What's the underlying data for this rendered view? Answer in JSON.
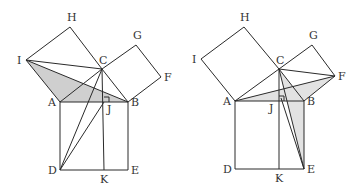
{
  "figures": [
    {
      "name": "left",
      "shade_color": "#cfcfcf",
      "points": {
        "H": [
          70,
          27
        ],
        "I": [
          26,
          60
        ],
        "C": [
          102,
          69
        ],
        "G": [
          136,
          45
        ],
        "F": [
          161,
          77
        ],
        "A": [
          60,
          102
        ],
        "B": [
          128,
          102
        ],
        "J": [
          104,
          102
        ],
        "D": [
          60,
          170
        ],
        "K": [
          104,
          170
        ],
        "E": [
          128,
          170
        ]
      },
      "shaded": [
        [
          "I",
          "A",
          "B"
        ]
      ],
      "segments": [
        [
          "A",
          "I"
        ],
        [
          "I",
          "H"
        ],
        [
          "H",
          "C"
        ],
        [
          "C",
          "A"
        ],
        [
          "C",
          "G"
        ],
        [
          "G",
          "F"
        ],
        [
          "F",
          "B"
        ],
        [
          "B",
          "C"
        ],
        [
          "A",
          "B"
        ],
        [
          "A",
          "D"
        ],
        [
          "D",
          "E"
        ],
        [
          "E",
          "B"
        ],
        [
          "C",
          "K"
        ],
        [
          "I",
          "C"
        ],
        [
          "I",
          "B"
        ],
        [
          "D",
          "C"
        ],
        [
          "D",
          "J"
        ]
      ],
      "labels": [
        {
          "text": "H",
          "pt": "H",
          "dx": -3,
          "dy": -6
        },
        {
          "text": "I",
          "pt": "I",
          "dx": -9,
          "dy": 4
        },
        {
          "text": "C",
          "pt": "C",
          "dx": -3,
          "dy": -5
        },
        {
          "text": "G",
          "pt": "G",
          "dx": -3,
          "dy": -6
        },
        {
          "text": "F",
          "pt": "F",
          "dx": 3,
          "dy": 4
        },
        {
          "text": "A",
          "pt": "A",
          "dx": -12,
          "dy": 4
        },
        {
          "text": "J",
          "pt": "J",
          "dx": 3,
          "dy": 11
        },
        {
          "text": "B",
          "pt": "B",
          "dx": 3,
          "dy": 4
        },
        {
          "text": "D",
          "pt": "D",
          "dx": -12,
          "dy": 4
        },
        {
          "text": "K",
          "pt": "K",
          "dx": -4,
          "dy": 13
        },
        {
          "text": "E",
          "pt": "E",
          "dx": 3,
          "dy": 4
        }
      ]
    },
    {
      "name": "right",
      "shade_color": "#e2e2e2",
      "points": {
        "H": [
          244,
          27
        ],
        "I": [
          201,
          59
        ],
        "C": [
          279,
          69
        ],
        "G": [
          312,
          45
        ],
        "F": [
          335,
          76
        ],
        "A": [
          235,
          101
        ],
        "B": [
          304,
          101
        ],
        "J": [
          279,
          101
        ],
        "D": [
          235,
          169
        ],
        "K": [
          279,
          169
        ],
        "E": [
          304,
          169
        ],
        "P": [
          281,
          98
        ]
      },
      "shaded": [
        [
          "A",
          "F",
          "B"
        ],
        [
          "C",
          "B",
          "E"
        ]
      ],
      "segments": [
        [
          "A",
          "I"
        ],
        [
          "I",
          "H"
        ],
        [
          "H",
          "C"
        ],
        [
          "C",
          "A"
        ],
        [
          "C",
          "G"
        ],
        [
          "G",
          "F"
        ],
        [
          "F",
          "B"
        ],
        [
          "B",
          "C"
        ],
        [
          "A",
          "B"
        ],
        [
          "A",
          "D"
        ],
        [
          "D",
          "E"
        ],
        [
          "E",
          "B"
        ],
        [
          "C",
          "K"
        ],
        [
          "C",
          "F"
        ],
        [
          "A",
          "F"
        ],
        [
          "C",
          "E"
        ],
        [
          "P",
          "E"
        ]
      ],
      "labels": [
        {
          "text": "H",
          "pt": "H",
          "dx": -4,
          "dy": -6
        },
        {
          "text": "I",
          "pt": "I",
          "dx": -9,
          "dy": 4
        },
        {
          "text": "C",
          "pt": "C",
          "dx": -3,
          "dy": -5
        },
        {
          "text": "G",
          "pt": "G",
          "dx": -3,
          "dy": -6
        },
        {
          "text": "F",
          "pt": "F",
          "dx": 3,
          "dy": 4
        },
        {
          "text": "A",
          "pt": "A",
          "dx": -12,
          "dy": 4
        },
        {
          "text": "J",
          "pt": "J",
          "dx": -10,
          "dy": 11
        },
        {
          "text": "B",
          "pt": "B",
          "dx": 3,
          "dy": 4
        },
        {
          "text": "D",
          "pt": "D",
          "dx": -12,
          "dy": 4
        },
        {
          "text": "K",
          "pt": "K",
          "dx": -4,
          "dy": 13
        },
        {
          "text": "E",
          "pt": "E",
          "dx": 3,
          "dy": 4
        }
      ]
    }
  ]
}
